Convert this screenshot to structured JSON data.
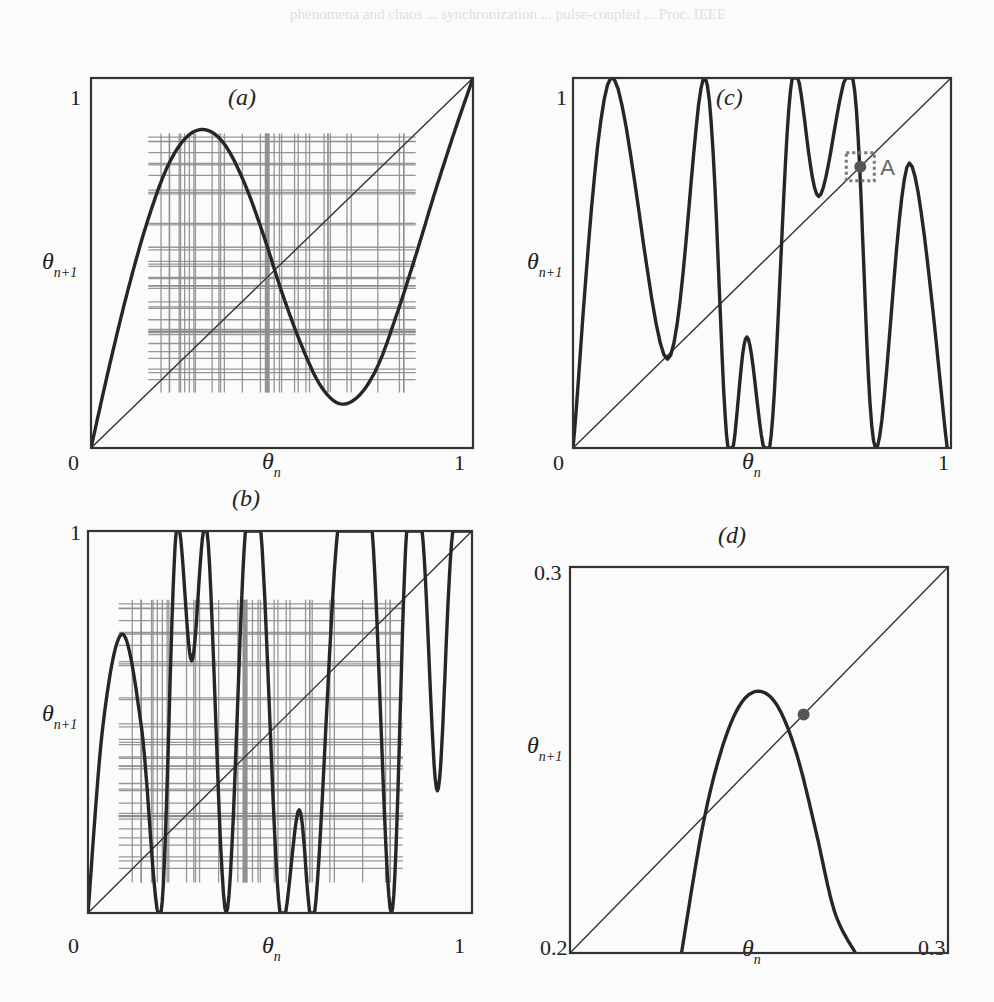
{
  "figure": {
    "background_text": "phenomena and chaos ... synchronization ... pulse-coupled ... Proc. IEEE",
    "fixed_point_label": "A"
  },
  "chart_data": [
    {
      "id": "a",
      "type": "line",
      "title": "(a)",
      "xlabel": "θ_n",
      "ylabel": "θ_{n+1}",
      "xlim": [
        0,
        1
      ],
      "ylim": [
        0,
        1
      ],
      "x_ticks": [
        "0",
        "1"
      ],
      "y_ticks": [
        "1"
      ],
      "description": "Return map with cobweb iterations (gray) around the diagonal",
      "series": [
        {
          "name": "map",
          "x": [
            0,
            0.05,
            0.1,
            0.15,
            0.2,
            0.25,
            0.3,
            0.35,
            0.4,
            0.45,
            0.5,
            0.55,
            0.6,
            0.65,
            0.7,
            0.75,
            0.8,
            0.85,
            0.9,
            0.95,
            1.0
          ],
          "y": [
            0,
            0.23,
            0.44,
            0.62,
            0.76,
            0.84,
            0.86,
            0.82,
            0.72,
            0.58,
            0.42,
            0.28,
            0.17,
            0.12,
            0.14,
            0.22,
            0.36,
            0.52,
            0.69,
            0.85,
            1.0
          ]
        },
        {
          "name": "diagonal",
          "x": [
            0,
            1
          ],
          "y": [
            0,
            1
          ]
        }
      ],
      "cobweb_range": [
        0.15,
        0.85
      ]
    },
    {
      "id": "b",
      "type": "line",
      "title": "(b)",
      "xlabel": "θ_n",
      "ylabel": "θ_{n+1}",
      "xlim": [
        0,
        1
      ],
      "ylim": [
        0,
        1
      ],
      "x_ticks": [
        "0",
        "1"
      ],
      "y_ticks": [
        "1"
      ],
      "description": "Higher-iterate return map with cobweb (gray)",
      "series": [
        {
          "name": "map",
          "x": [
            0,
            0.04,
            0.09,
            0.14,
            0.19,
            0.23,
            0.27,
            0.31,
            0.36,
            0.41,
            0.45,
            0.5,
            0.55,
            0.59,
            0.65,
            0.7,
            0.74,
            0.79,
            0.83,
            0.87,
            0.91,
            0.95,
            1.0
          ],
          "y": [
            0,
            0.5,
            0.73,
            0.48,
            0.0,
            1.0,
            0.66,
            1.0,
            0.0,
            1.0,
            1.0,
            0.0,
            0.27,
            0.0,
            1.0,
            1.0,
            1.0,
            0.0,
            1.0,
            1.0,
            0.32,
            1.0,
            1.0
          ]
        },
        {
          "name": "diagonal",
          "x": [
            0,
            1
          ],
          "y": [
            0,
            1
          ]
        }
      ],
      "cobweb_range": [
        0.08,
        0.82
      ]
    },
    {
      "id": "c",
      "type": "line",
      "title": "(c)",
      "xlabel": "θ_n",
      "ylabel": "θ_{n+1}",
      "xlim": [
        0,
        1
      ],
      "ylim": [
        0,
        1
      ],
      "x_ticks": [
        "0",
        "1"
      ],
      "y_ticks": [
        "1"
      ],
      "description": "Return map with stable fixed point A marked by dashed box",
      "series": [
        {
          "name": "map",
          "x": [
            0,
            0.1,
            0.25,
            0.35,
            0.41,
            0.46,
            0.52,
            0.58,
            0.65,
            0.74,
            0.8,
            0.89,
            0.99
          ],
          "y": [
            0,
            1.0,
            0.24,
            1.0,
            0.0,
            0.3,
            0.0,
            1.0,
            0.68,
            1.0,
            0.0,
            0.77,
            0.0
          ]
        },
        {
          "name": "diagonal",
          "x": [
            0,
            1
          ],
          "y": [
            0,
            1
          ]
        }
      ],
      "fixed_point": {
        "label": "A",
        "x": 0.76,
        "y": 0.76
      }
    },
    {
      "id": "d",
      "type": "line",
      "title": "(d)",
      "xlabel": "θ_n",
      "ylabel": "θ_{n+1}",
      "xlim": [
        0.2,
        0.3
      ],
      "ylim": [
        0.2,
        0.3
      ],
      "x_ticks": [
        "0.2",
        "0.3"
      ],
      "y_ticks": [
        "0.3"
      ],
      "description": "Zoom near fixed point A",
      "series": [
        {
          "name": "map",
          "x": [
            0.2295,
            0.235,
            0.24,
            0.245,
            0.25,
            0.255,
            0.26,
            0.265,
            0.27,
            0.2755
          ],
          "y": [
            0.2,
            0.2323,
            0.2524,
            0.2643,
            0.2678,
            0.2638,
            0.2514,
            0.2318,
            0.2107,
            0.2
          ]
        },
        {
          "name": "diagonal",
          "x": [
            0.2,
            0.3
          ],
          "y": [
            0.2,
            0.3
          ]
        }
      ],
      "fixed_point": {
        "x": 0.2618,
        "y": 0.2618
      }
    }
  ]
}
